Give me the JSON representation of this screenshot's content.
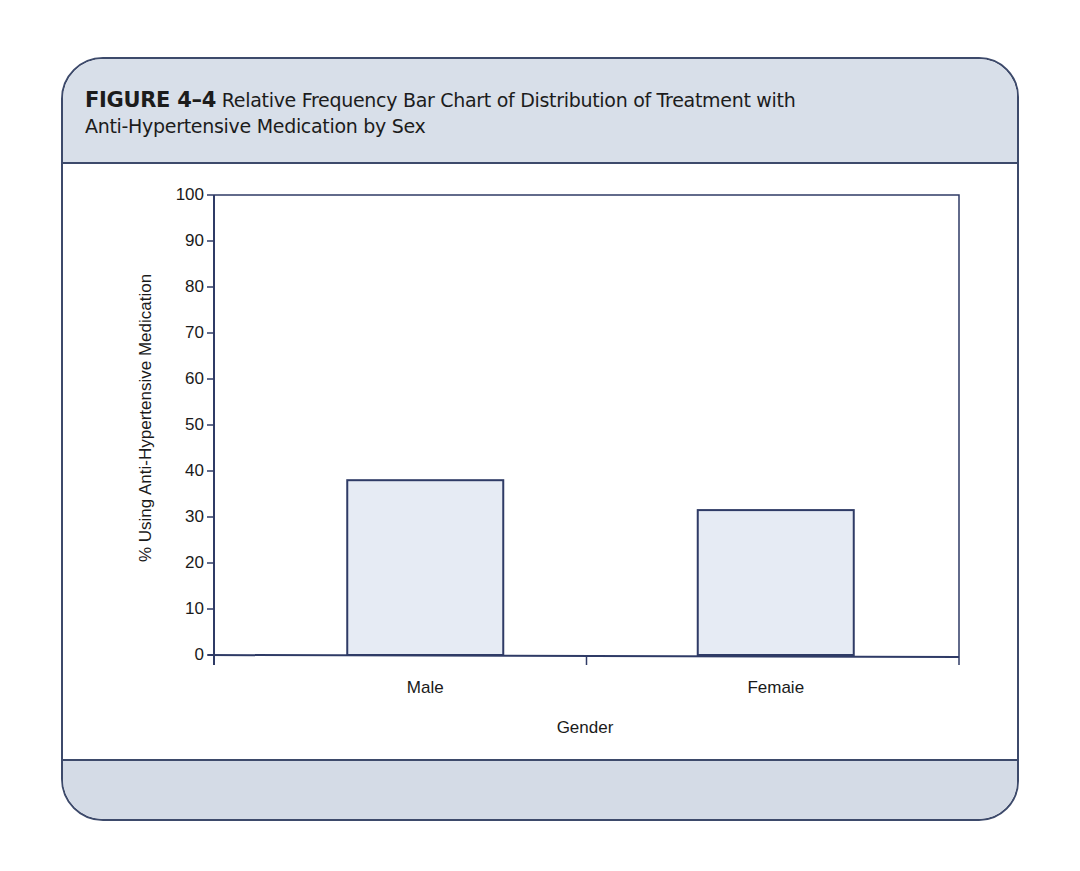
{
  "figure": {
    "label": "FIGURE 4–4",
    "title_line1": "Relative Frequency Bar Chart of Distribution of Treatment with",
    "title_line2": "Anti-Hypertensive Medication by Sex"
  },
  "colors": {
    "frame_border": "#3d4a6b",
    "header_bg": "#d8dfe9",
    "bar_fill": "#e6ebf4",
    "bar_border": "#2f3b66",
    "axis": "#2f3b66"
  },
  "chart_data": {
    "type": "bar",
    "title": "Relative Frequency Bar Chart of Distribution of Treatment with Anti-Hypertensive Medication by Sex",
    "categories": [
      "Male",
      "Femaie"
    ],
    "values": [
      38,
      31.5
    ],
    "xlabel": "Gender",
    "ylabel": "% Using Anti-Hypertensive Medication",
    "ylim": [
      0,
      100
    ],
    "yticks": [
      0,
      10,
      20,
      30,
      40,
      50,
      60,
      70,
      80,
      90,
      100
    ],
    "grid": false,
    "legend": null
  }
}
